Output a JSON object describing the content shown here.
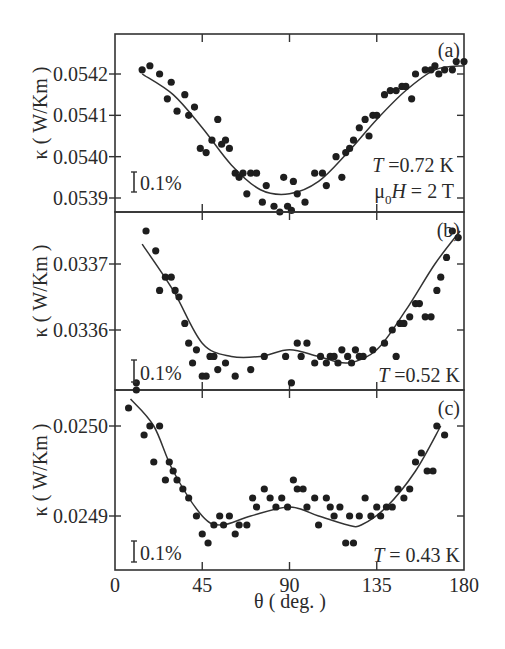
{
  "figure": {
    "xlabel": "θ ( deg. )",
    "ylabel": "κ ( W/Km )",
    "x_ticks": [
      "0",
      "45",
      "90",
      "135",
      "180"
    ],
    "scale_bar_label": "0.1%"
  },
  "chart_data": [
    {
      "type": "scatter",
      "panel": "(a)",
      "title": "",
      "annotation": [
        "T =0.72 K",
        "μ0H = 2 T"
      ],
      "xlabel": "θ ( deg. )",
      "ylabel": "κ ( W/Km )",
      "xlim": [
        0,
        180
      ],
      "ylim": [
        0.05386,
        0.05428
      ],
      "y_ticks": [
        "0.0542",
        "0.0541",
        "0.0540",
        "0.0539"
      ],
      "y_tick_values": [
        0.0542,
        0.0541,
        0.054,
        0.0539
      ],
      "scale_bar": "0.1%",
      "series": [
        {
          "name": "data",
          "x": [
            14,
            18,
            23,
            27,
            29,
            32,
            36,
            38,
            41,
            44,
            47,
            50,
            53,
            55,
            57,
            59,
            62,
            64,
            66,
            68,
            70,
            73,
            76,
            78,
            82,
            85,
            87,
            89,
            91,
            92,
            94,
            98,
            103,
            107,
            109,
            114,
            117,
            119,
            121,
            123,
            126,
            129,
            131,
            133,
            135,
            139,
            142,
            145,
            148,
            150,
            153,
            155,
            160,
            163,
            165,
            167,
            170,
            174,
            176,
            180
          ],
          "y": [
            0.05421,
            0.05422,
            0.0542,
            0.05414,
            0.05418,
            0.05411,
            0.05415,
            0.0541,
            0.05412,
            0.05402,
            0.05401,
            0.05404,
            0.05409,
            0.05403,
            0.05404,
            0.05402,
            0.05396,
            0.05395,
            0.05396,
            0.05391,
            0.05396,
            0.05396,
            0.05389,
            0.05393,
            0.05388,
            0.05386,
            0.05395,
            0.05388,
            0.05387,
            0.05394,
            0.05391,
            0.05389,
            0.05396,
            0.05396,
            0.05393,
            0.054,
            0.05395,
            0.05401,
            0.05402,
            0.05404,
            0.05407,
            0.05409,
            0.05405,
            0.0541,
            0.0541,
            0.05415,
            0.05416,
            0.05416,
            0.05417,
            0.05417,
            0.05414,
            0.0542,
            0.05421,
            0.05421,
            0.05422,
            0.0542,
            0.05421,
            0.05421,
            0.05423,
            0.05423
          ]
        },
        {
          "name": "fit",
          "x": [
            14,
            30,
            45,
            60,
            75,
            90,
            105,
            120,
            135,
            150,
            165,
            180
          ],
          "y": [
            0.0542,
            0.05415,
            0.05407,
            0.05398,
            0.05392,
            0.05391,
            0.05394,
            0.05401,
            0.05409,
            0.05416,
            0.05421,
            0.05422
          ]
        }
      ]
    },
    {
      "type": "scatter",
      "panel": "(b)",
      "annotation": [
        "T =0.52 K"
      ],
      "xlabel": "θ ( deg. )",
      "ylabel": "κ ( W/Km )",
      "xlim": [
        0,
        180
      ],
      "ylim": [
        0.03352,
        0.03378
      ],
      "y_ticks": [
        "0.0337",
        "0.0336"
      ],
      "y_tick_values": [
        0.0337,
        0.0336
      ],
      "scale_bar": "0.1%",
      "series": [
        {
          "name": "data",
          "x": [
            11,
            16,
            21,
            23,
            26,
            29,
            31,
            33,
            36,
            38,
            40,
            42,
            45,
            47,
            49,
            51,
            53,
            57,
            62,
            70,
            77,
            88,
            91,
            94,
            96,
            99,
            103,
            106,
            109,
            111,
            113,
            115,
            117,
            120,
            122,
            124,
            126,
            128,
            133,
            139,
            143,
            145,
            147,
            149,
            152,
            155,
            157,
            160,
            163,
            166,
            168,
            171,
            174,
            177
          ],
          "y": [
            0.03352,
            0.03375,
            0.03372,
            0.03366,
            0.03368,
            0.03368,
            0.03366,
            0.03365,
            0.03361,
            0.03358,
            0.03355,
            0.03357,
            0.03353,
            0.03353,
            0.03356,
            0.03356,
            0.03354,
            0.03355,
            0.03353,
            0.03354,
            0.03356,
            0.03356,
            0.03352,
            0.03358,
            0.03356,
            0.03358,
            0.03355,
            0.03356,
            0.03355,
            0.03356,
            0.03356,
            0.03355,
            0.03357,
            0.03356,
            0.03355,
            0.03357,
            0.03356,
            0.03356,
            0.03357,
            0.03358,
            0.0336,
            0.03356,
            0.03361,
            0.03361,
            0.03362,
            0.03364,
            0.03364,
            0.03362,
            0.03362,
            0.03366,
            0.03368,
            0.03371,
            0.03375,
            0.03374
          ]
        },
        {
          "name": "fit",
          "x": [
            14,
            30,
            45,
            60,
            75,
            90,
            105,
            120,
            135,
            150,
            165,
            178
          ],
          "y": [
            0.03373,
            0.03366,
            0.03358,
            0.03356,
            0.03356,
            0.03357,
            0.03356,
            0.03355,
            0.03357,
            0.03363,
            0.0337,
            0.03375
          ]
        }
      ]
    },
    {
      "type": "scatter",
      "panel": "(c)",
      "annotation": [
        "T = 0.43 K"
      ],
      "xlabel": "θ ( deg. )",
      "ylabel": "κ ( W/Km )",
      "xlim": [
        0,
        180
      ],
      "ylim": [
        0.024855,
        0.025045
      ],
      "y_ticks": [
        "0.0250",
        "0.0249"
      ],
      "y_tick_values": [
        0.025,
        0.0249
      ],
      "x_ticks": [
        0,
        45,
        90,
        135,
        180
      ],
      "scale_bar": "0.1%",
      "series": [
        {
          "name": "data",
          "x": [
            7,
            11,
            15,
            18,
            20,
            23,
            26,
            28,
            30,
            32,
            35,
            38,
            42,
            45,
            48,
            51,
            54,
            56,
            59,
            62,
            64,
            68,
            71,
            73,
            77,
            80,
            83,
            86,
            89,
            92,
            94,
            97,
            99,
            103,
            105,
            109,
            111,
            113,
            116,
            119,
            121,
            123,
            126,
            129,
            132,
            135,
            137,
            140,
            143,
            146,
            149,
            152,
            155,
            158,
            161,
            164,
            166,
            170
          ],
          "y": [
            0.02502,
            0.02504,
            0.02499,
            0.025,
            0.02496,
            0.025,
            0.02494,
            0.02496,
            0.02495,
            0.02494,
            0.02493,
            0.02492,
            0.0249,
            0.02488,
            0.02487,
            0.02489,
            0.0249,
            0.02489,
            0.0249,
            0.02488,
            0.02489,
            0.02489,
            0.02492,
            0.02491,
            0.02493,
            0.02492,
            0.02491,
            0.02492,
            0.02491,
            0.02494,
            0.02493,
            0.02493,
            0.02491,
            0.02492,
            0.02489,
            0.02492,
            0.02491,
            0.0249,
            0.02491,
            0.02487,
            0.0249,
            0.02487,
            0.0249,
            0.02492,
            0.0249,
            0.02491,
            0.0249,
            0.02491,
            0.02491,
            0.02493,
            0.02492,
            0.02493,
            0.02496,
            0.02497,
            0.02495,
            0.02495,
            0.025,
            0.02499
          ]
        },
        {
          "name": "fit",
          "x": [
            8,
            20,
            30,
            45,
            55,
            70,
            90,
            105,
            120,
            127,
            140,
            155,
            168
          ],
          "y": [
            0.02503,
            0.025,
            0.02495,
            0.0249,
            0.02489,
            0.0249,
            0.02491,
            0.0249,
            0.02489,
            0.02489,
            0.02491,
            0.02495,
            0.025
          ]
        }
      ]
    }
  ]
}
